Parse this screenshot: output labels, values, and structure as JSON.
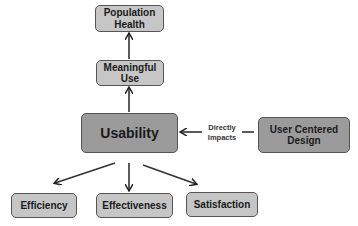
{
  "diagram": {
    "nodes": {
      "population_health": "Population Health",
      "meaningful_use": "Meaningful Use",
      "usability": "Usability",
      "user_centered_design": "User Centered Design",
      "efficiency": "Efficiency",
      "effectiveness": "Effectiveness",
      "satisfaction": "Satisfaction"
    },
    "edge_labels": {
      "ucd_to_usability_line1": "Directly",
      "ucd_to_usability_line2": "Impacts"
    },
    "edges": [
      {
        "from": "meaningful_use",
        "to": "population_health"
      },
      {
        "from": "usability",
        "to": "meaningful_use"
      },
      {
        "from": "user_centered_design",
        "to": "usability",
        "label": "Directly Impacts"
      },
      {
        "from": "usability",
        "to": "efficiency"
      },
      {
        "from": "usability",
        "to": "effectiveness"
      },
      {
        "from": "usability",
        "to": "satisfaction"
      }
    ],
    "colors": {
      "box_fill_light": "#c6c6c6",
      "box_fill_dark": "#9b9b9b",
      "stroke": "#333333"
    }
  }
}
